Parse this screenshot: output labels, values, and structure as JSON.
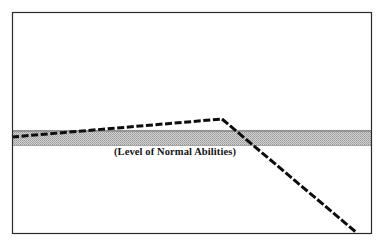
{
  "figure": {
    "label": "(Level of Normal Abilities)",
    "colors": {
      "frame": "#2b2b2b",
      "curve": "#0d0d0d",
      "band_fill": "#b3b3b3",
      "band_edge": "#8f8f8f",
      "background": "#ffffff"
    }
  },
  "chart_data": {
    "type": "line",
    "title": "",
    "subtitle": "",
    "xlabel": "",
    "ylabel": "",
    "xlim": [
      0,
      383
    ],
    "ylim": [
      246,
      0
    ],
    "grid": false,
    "legend": null,
    "annotations": [
      {
        "text": "(Level of Normal Abilities)",
        "x": 175,
        "y": 155,
        "style": "bold-serif"
      }
    ],
    "bands": [
      {
        "name": "level-of-normal-abilities-band",
        "orientation": "horizontal",
        "x_start": 12,
        "x_end": 371,
        "y_top": 130,
        "y_bottom": 146,
        "fill": "#b3b3b3",
        "pattern": "dither-gray"
      }
    ],
    "series": [
      {
        "name": "ability-trajectory",
        "style": "dashed-thick",
        "color": "#0d0d0d",
        "points": [
          {
            "x": 12,
            "y": 137
          },
          {
            "x": 222,
            "y": 119
          }
        ]
      },
      {
        "name": "decline-trajectory",
        "style": "dashed-thick",
        "color": "#0d0d0d",
        "points": [
          {
            "x": 222,
            "y": 119
          },
          {
            "x": 357,
            "y": 233
          }
        ]
      }
    ],
    "frame": {
      "x_left": 12,
      "x_right": 371,
      "y_top": 12,
      "y_bottom": 233,
      "stroke": "#2b2b2b",
      "stroke_width": 1
    }
  }
}
